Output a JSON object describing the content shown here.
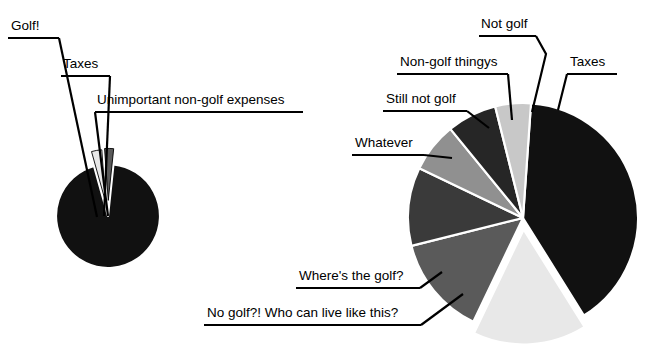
{
  "figure": {
    "title": "",
    "background": "#ffffff",
    "width": 657,
    "height": 354
  },
  "palette": {
    "black": "#111111",
    "near_black": "#1a1a1a",
    "dark_gray": "#262626",
    "mid_dark_gray": "#3a3a3a",
    "mid_gray": "#5a5a5a",
    "light_mid_gray": "#909090",
    "light_gray": "#c8c8c8",
    "very_light_gray": "#e8e8e8",
    "white": "#ffffff",
    "outline": "#000000"
  },
  "chart_data": [
    {
      "type": "pie",
      "name": "left-pie",
      "title": "",
      "center": [
        108,
        216
      ],
      "radius": 52,
      "start_angle_deg": -84,
      "labels": [
        "Golf!",
        "Taxes",
        "Unimportant non-golf expenses"
      ],
      "values": [
        94,
        3.2,
        2.8
      ],
      "colors": [
        "#111111",
        "#e8e8e8",
        "#5a5a5a"
      ],
      "explode": [
        0,
        0.28,
        0.3
      ],
      "legend": "callout-labels"
    },
    {
      "type": "pie",
      "name": "right-pie",
      "title": "",
      "center": [
        523,
        218
      ],
      "radius": 115,
      "start_angle_deg": -86,
      "labels": [
        "Taxes",
        "No golf?! Who can live like this?",
        "Where's the golf?",
        "Whatever",
        "Still not golf",
        "Non-golf thingys",
        "Not golf"
      ],
      "values": [
        40,
        16,
        14,
        11,
        7,
        7,
        5
      ],
      "colors": [
        "#111111",
        "#e8e8e8",
        "#5a5a5a",
        "#3a3a3a",
        "#909090",
        "#262626",
        "#c8c8c8"
      ],
      "explode": [
        0,
        0.1,
        0,
        0,
        0,
        0,
        0
      ],
      "legend": "callout-labels"
    }
  ],
  "left_chart": {
    "callouts": [
      {
        "id": "golf",
        "text": "Golf!",
        "text_x": 11,
        "text_y": 30,
        "underline_x1": 8,
        "underline_x2": 59,
        "underline_y": 38,
        "leader_points": "59,38 97,217"
      },
      {
        "id": "taxes",
        "text": "Taxes",
        "text_x": 63,
        "text_y": 68,
        "underline_x1": 61,
        "underline_x2": 110,
        "underline_y": 76,
        "leader_points": "110,76 104,216"
      },
      {
        "id": "unimportant",
        "text": "Unimportant non-golf expenses",
        "text_x": 97,
        "text_y": 104,
        "underline_x1": 95,
        "underline_x2": 303,
        "underline_y": 112,
        "leader_points": "95,112 108,216"
      }
    ]
  },
  "right_chart": {
    "callouts": [
      {
        "id": "not-golf",
        "text": "Not golf",
        "text_x": 481,
        "text_y": 28,
        "underline_x1": 479,
        "underline_x2": 536,
        "underline_y": 36,
        "leader_points": "536,36 546,54 532,112"
      },
      {
        "id": "non-golf-thingys",
        "text": "Non-golf thingys",
        "text_x": 400,
        "text_y": 66,
        "underline_x1": 397,
        "underline_x2": 508,
        "underline_y": 74,
        "leader_points": "508,74 512,120"
      },
      {
        "id": "taxes",
        "text": "Taxes",
        "text_x": 570,
        "text_y": 66,
        "underline_x1": 567,
        "underline_x2": 617,
        "underline_y": 74,
        "leader_points": "567,74 558,110"
      },
      {
        "id": "still-not-golf",
        "text": "Still not golf",
        "text_x": 386,
        "text_y": 103,
        "underline_x1": 383,
        "underline_x2": 467,
        "underline_y": 111,
        "leader_points": "467,111 489,128"
      },
      {
        "id": "whatever",
        "text": "Whatever",
        "text_x": 355,
        "text_y": 147,
        "underline_x1": 352,
        "underline_x2": 424,
        "underline_y": 155,
        "leader_points": "424,155 452,158"
      },
      {
        "id": "wheres-the-golf",
        "text": "Where's the golf?",
        "text_x": 299,
        "text_y": 280,
        "underline_x1": 296,
        "underline_x2": 420,
        "underline_y": 288,
        "leader_points": "420,288 442,272"
      },
      {
        "id": "no-golf",
        "text": "No golf?! Who can live like this?",
        "text_x": 207,
        "text_y": 317,
        "underline_x1": 204,
        "underline_x2": 421,
        "underline_y": 325,
        "leader_points": "421,325 463,294"
      }
    ]
  }
}
